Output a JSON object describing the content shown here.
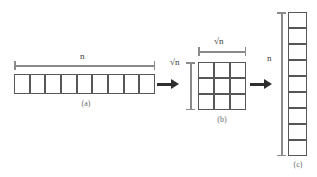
{
  "figure": {
    "background_color": "#ffffff",
    "cell_border_color": "#575757",
    "dimension_line_color": "#8a8a8a",
    "arrow_color": "#2e2e2e",
    "label_color": "#3b3b3b",
    "caption_color": "#6b6b6b"
  },
  "panel_a": {
    "caption": "(a)",
    "dimension_label": "n",
    "cell_count": 9,
    "orientation": "horizontal"
  },
  "panel_b": {
    "caption": "(b)",
    "dimension_label_top": "√n",
    "dimension_label_left": "√n",
    "radical_symbol": "√",
    "radicand": "n",
    "rows": 3,
    "columns": 3,
    "cell_count": 9,
    "orientation": "grid"
  },
  "panel_c": {
    "caption": "(c)",
    "dimension_label": "n",
    "cell_count": 9,
    "orientation": "vertical"
  },
  "arrows": [
    {
      "name": "arrow-a-to-b",
      "direction": "right"
    },
    {
      "name": "arrow-b-to-c",
      "direction": "right"
    }
  ],
  "chart_data": {
    "type": "diagram",
    "stages": [
      {
        "label": "(a)",
        "shape": "1 x 9",
        "dimension": "n",
        "cells": 9
      },
      {
        "label": "(b)",
        "shape": "3 x 3",
        "dimension": "√n",
        "cells": 9
      },
      {
        "label": "(c)",
        "shape": "9 x 1",
        "dimension": "n",
        "cells": 9
      }
    ]
  }
}
